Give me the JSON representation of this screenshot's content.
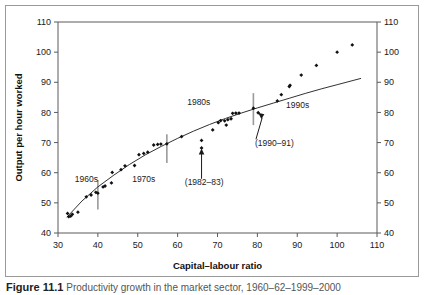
{
  "figure": {
    "caption_label": "Figure 11.1",
    "caption_text": "Productivity  growth  in  the  market  sector,  1960–62–1999–2000"
  },
  "chart_data": {
    "type": "scatter",
    "title": "",
    "xlabel": "Capital–labour ratio",
    "ylabel": "Output per hour worked",
    "ylabel_right": "Output per hour worked",
    "xlim": [
      30,
      110
    ],
    "ylim": [
      40,
      110
    ],
    "xticks": [
      30,
      40,
      50,
      60,
      70,
      80,
      90,
      100,
      110
    ],
    "yticks": [
      40,
      50,
      60,
      70,
      80,
      90,
      100,
      110
    ],
    "yticks_right": [
      40,
      50,
      60,
      70,
      80,
      90,
      100,
      110
    ],
    "grid": false,
    "legend": "none",
    "marker": "diamond",
    "marker_color": "#111111",
    "series": [
      {
        "name": "Observations",
        "points": [
          [
            32.4,
            46.5
          ],
          [
            32.7,
            45.4
          ],
          [
            33.2,
            45.6
          ],
          [
            33.6,
            46.2
          ],
          [
            35.0,
            46.9
          ],
          [
            37.1,
            52.0
          ],
          [
            38.3,
            52.6
          ],
          [
            39.5,
            53.5
          ],
          [
            40.0,
            53.2
          ],
          [
            41.3,
            55.3
          ],
          [
            41.8,
            55.6
          ],
          [
            43.4,
            56.6
          ],
          [
            43.6,
            60.1
          ],
          [
            45.8,
            61.0
          ],
          [
            46.8,
            62.3
          ],
          [
            49.2,
            62.4
          ],
          [
            50.3,
            66.0
          ],
          [
            51.5,
            66.4
          ],
          [
            52.5,
            66.8
          ],
          [
            54.0,
            69.2
          ],
          [
            55.0,
            69.4
          ],
          [
            55.8,
            69.5
          ],
          [
            57.3,
            69.6
          ],
          [
            61.0,
            72.0
          ],
          [
            66.0,
            70.7
          ],
          [
            66.0,
            68.2
          ],
          [
            68.8,
            74.2
          ],
          [
            70.2,
            76.6
          ],
          [
            70.8,
            77.3
          ],
          [
            71.8,
            77.2
          ],
          [
            72.2,
            75.8
          ],
          [
            72.6,
            77.6
          ],
          [
            73.4,
            77.9
          ],
          [
            73.8,
            79.7
          ],
          [
            74.6,
            79.8
          ],
          [
            75.4,
            79.8
          ],
          [
            79.0,
            81.4
          ],
          [
            80.2,
            79.9
          ],
          [
            85.0,
            83.8
          ],
          [
            86.0,
            85.9
          ],
          [
            88.0,
            88.6
          ],
          [
            88.2,
            89.0
          ],
          [
            91.0,
            92.4
          ],
          [
            94.8,
            95.6
          ],
          [
            100.0,
            100.0
          ],
          [
            103.8,
            102.4
          ]
        ]
      }
    ],
    "trend_curve": {
      "name": "Fitted trend",
      "points": [
        [
          32.2,
          45.2
        ],
        [
          36.0,
          50.6
        ],
        [
          40.0,
          55.3
        ],
        [
          44.0,
          59.2
        ],
        [
          48.0,
          62.8
        ],
        [
          52.0,
          66.0
        ],
        [
          56.0,
          68.8
        ],
        [
          60.0,
          71.4
        ],
        [
          64.0,
          73.8
        ],
        [
          68.0,
          76.0
        ],
        [
          72.0,
          78.0
        ],
        [
          76.0,
          79.8
        ],
        [
          80.0,
          81.5
        ],
        [
          84.0,
          83.1
        ],
        [
          88.0,
          84.7
        ],
        [
          92.0,
          86.3
        ],
        [
          96.0,
          87.8
        ],
        [
          100.0,
          89.2
        ],
        [
          104.0,
          90.6
        ],
        [
          106.0,
          91.3
        ]
      ]
    },
    "era_dividers": [
      {
        "x": 40.0,
        "y_bottom": 47.8,
        "y_top": 57.6
      },
      {
        "x": 57.3,
        "y_bottom": 63.2,
        "y_top": 72.8
      },
      {
        "x": 79.0,
        "y_bottom": 75.8,
        "y_top": 86.4
      }
    ],
    "era_labels": [
      {
        "text": "1960s",
        "x": 34.2,
        "y": 56.8
      },
      {
        "text": "1970s",
        "x": 48.6,
        "y": 56.8
      },
      {
        "text": "1980s",
        "x": 62.4,
        "y": 82.5
      },
      {
        "text": "1990s",
        "x": 87.2,
        "y": 81.6
      }
    ],
    "annotations": [
      {
        "text": "(1982–83)",
        "label_x": 61.8,
        "label_y": 56.0,
        "target_x": 66.0,
        "target_y": 68.0,
        "arrow": "vertical-up"
      },
      {
        "text": "(1990–91)",
        "label_x": 79.4,
        "label_y": 68.8,
        "target_x": 80.2,
        "target_y": 79.9,
        "arrow": "diagonal-up-left"
      }
    ]
  }
}
